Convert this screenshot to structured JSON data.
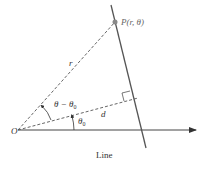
{
  "diagram": {
    "type": "polar line geometry",
    "labels": {
      "origin": "O",
      "point": "P(r, θ)",
      "point_name": "P",
      "point_args": "(r, θ)",
      "radius": "r",
      "distance": "d",
      "angle_diff": "θ − θ",
      "angle_diff_sub": "0",
      "angle0": "θ",
      "angle0_sub": "0",
      "caption": "Line"
    },
    "colors": {
      "line": "#555555",
      "point": "#888888",
      "text": "#333333"
    }
  }
}
